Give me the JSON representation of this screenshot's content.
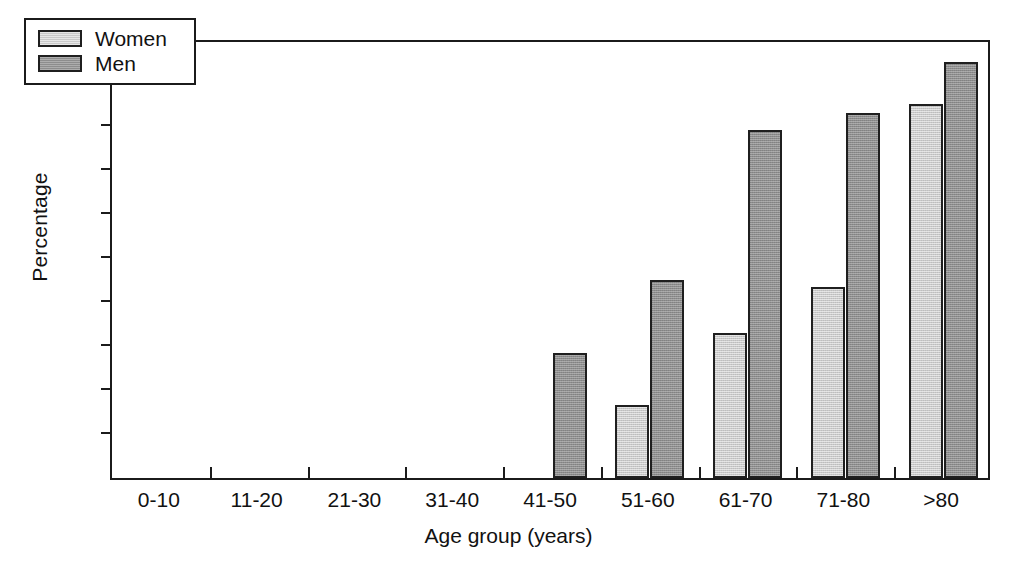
{
  "chart_data": {
    "type": "bar",
    "title": "",
    "xlabel": "Age group (years)",
    "ylabel": "Percentage",
    "categories": [
      "0-10",
      "11-20",
      "21-30",
      "31-40",
      "41-50",
      "51-60",
      "61-70",
      "71-80",
      ">80"
    ],
    "series": [
      {
        "name": "Women",
        "color": "#c9c9c9",
        "values": [
          0,
          0,
          0,
          0,
          0,
          16.5,
          33,
          43.5,
          85
        ]
      },
      {
        "name": "Men",
        "color": "#8d8d8d",
        "values": [
          0,
          0,
          0,
          0,
          28.5,
          45,
          79,
          83,
          94.5
        ]
      }
    ],
    "ylim": [
      0,
      100
    ],
    "yticks": [
      0,
      10,
      20,
      30,
      40,
      50,
      60,
      70,
      80,
      90,
      100
    ],
    "ytick_labels": [
      "0",
      "10",
      "20",
      "30",
      "40",
      "50",
      "60",
      "70",
      "80",
      "90",
      "100"
    ],
    "grid": false,
    "legend_position": "upper-left",
    "legend_entries": [
      "Women",
      "Men"
    ]
  }
}
